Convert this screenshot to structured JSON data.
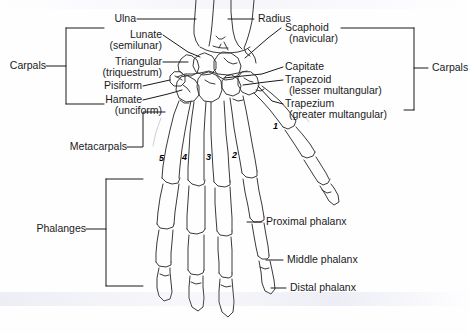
{
  "figure": {
    "ink_color": "#1a1a1a",
    "bone_outline_color": "#3a3a3a",
    "background_color": "#fefeff"
  },
  "labels": {
    "ulna": "Ulna",
    "radius": "Radius",
    "lunate": "Lunate",
    "lunate_alt": "(semilunar)",
    "triangular": "Triangular",
    "triangular_alt": "(triquestrum)",
    "pisiform": "Pisiform",
    "hamate": "Hamate",
    "hamate_alt": "(unciform)",
    "scaphoid": "Scaphoid",
    "scaphoid_alt": "(navicular)",
    "capitate": "Capitate",
    "trapezoid": "Trapezoid",
    "trapezoid_alt": "(lesser multangular)",
    "trapezium": "Trapezium",
    "trapezium_alt": "(greater multangular)",
    "carpals_left": "Carpals",
    "carpals_right": "Carpals",
    "metacarpals": "Metacarpals",
    "phalanges": "Phalanges",
    "proximal_phalanx": "Proximal phalanx",
    "middle_phalanx": "Middle phalanx",
    "distal_phalanx": "Distal phalanx"
  },
  "metacarpal_numbers": [
    "1",
    "2",
    "3",
    "4",
    "5"
  ]
}
